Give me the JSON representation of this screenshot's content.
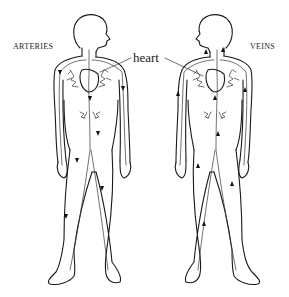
{
  "diagram": {
    "labels": {
      "left": "ARTERIES",
      "right": "VEINS",
      "center": "heart"
    },
    "figures": [
      {
        "id": "arteries-figure",
        "facing": "right",
        "arrow_direction": "away from heart (down limbs)"
      },
      {
        "id": "veins-figure",
        "facing": "left",
        "arrow_direction": "toward heart (up limbs)"
      }
    ],
    "colors": {
      "line": "#1a1a1a",
      "background": "#ffffff"
    }
  }
}
